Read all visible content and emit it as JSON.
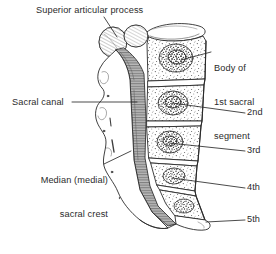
{
  "figure": {
    "kind": "anatomical-line-drawing",
    "background_color": "#ffffff",
    "ink_color": "#2b2b2b",
    "stipple_color": "#444444",
    "canal_shading_color": "#8a8a8a"
  },
  "labels": {
    "superior_articular_process": "Superior articular process",
    "body_1st_sacral_segment_line1": "Body of",
    "body_1st_sacral_segment_line2": "1st sacral",
    "body_1st_sacral_segment_line3": "segment",
    "sacral_canal": "Sacral canal",
    "median_sacral_crest_line1": "Median (medial)",
    "median_sacral_crest_line2": "sacral crest",
    "segment_2nd": "2nd",
    "segment_3rd": "3rd",
    "segment_4th": "4th",
    "segment_5th": "5th"
  }
}
